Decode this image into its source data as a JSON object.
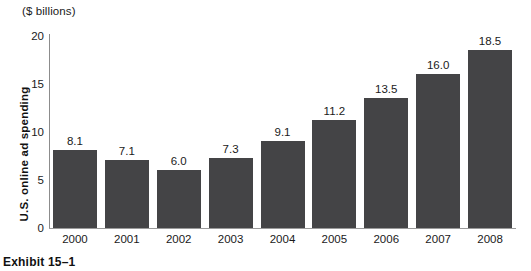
{
  "figure": {
    "unit_caption": "($ billions)",
    "exhibit_label": "Exhibit 15–1"
  },
  "chart_data": {
    "type": "bar",
    "title": "",
    "xlabel": "",
    "ylabel": "U.S. online ad spending",
    "unit_note": "($ billions)",
    "categories": [
      "2000",
      "2001",
      "2002",
      "2003",
      "2004",
      "2005",
      "2006",
      "2007",
      "2008"
    ],
    "values": [
      8.1,
      7.1,
      6.0,
      7.3,
      9.1,
      11.2,
      13.5,
      16.0,
      18.5
    ],
    "value_labels": [
      "8.1",
      "7.1",
      "6.0",
      "7.3",
      "9.1",
      "11.2",
      "13.5",
      "16.0",
      "18.5"
    ],
    "ylim": [
      0,
      20
    ],
    "yticks": [
      0,
      5,
      10,
      15,
      20
    ],
    "ytick_labels": [
      "0",
      "5",
      "10",
      "15",
      "20"
    ],
    "grid": false,
    "legend": false,
    "bar_color": "#444446",
    "axis_color": "#8c8c8c"
  }
}
